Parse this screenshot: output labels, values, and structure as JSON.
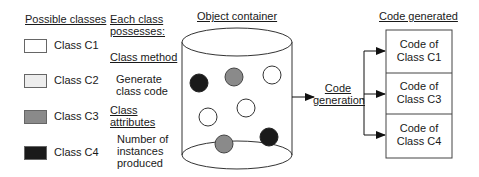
{
  "legend": {
    "title": "Possible classes",
    "items": [
      {
        "label": "Class C1",
        "color": "#ffffff"
      },
      {
        "label": "Class C2",
        "color": "#ededed"
      },
      {
        "label": "Class C3",
        "color": "#8a8a8a"
      },
      {
        "label": "Class C4",
        "color": "#1a1a1a"
      }
    ]
  },
  "properties": {
    "title_line1": "Each class",
    "title_line2": "possesses:",
    "method_heading": "Class method",
    "method_line1": "Generate",
    "method_line2": "class code",
    "attributes_heading_line1": "Class",
    "attributes_heading_line2": "attributes",
    "attributes_line1": "Number of",
    "attributes_line2": "instances",
    "attributes_line3": "produced"
  },
  "container": {
    "title": "Object container",
    "objects": [
      {
        "class": "C4",
        "cx": 199,
        "cy": 83
      },
      {
        "class": "C3",
        "cx": 234,
        "cy": 77
      },
      {
        "class": "C1",
        "cx": 272,
        "cy": 75
      },
      {
        "class": "C1",
        "cx": 246,
        "cy": 108
      },
      {
        "class": "C1",
        "cx": 208,
        "cy": 117
      },
      {
        "class": "C3",
        "cx": 224,
        "cy": 144
      },
      {
        "class": "C4",
        "cx": 269,
        "cy": 137
      }
    ]
  },
  "process": {
    "line1": "Code",
    "line2": "generation"
  },
  "output": {
    "title": "Code generated",
    "rows": [
      {
        "line1": "Code of",
        "line2": "Class C1"
      },
      {
        "line1": "Code of",
        "line2": "Class C3"
      },
      {
        "line1": "Code of",
        "line2": "Class C4"
      }
    ]
  }
}
